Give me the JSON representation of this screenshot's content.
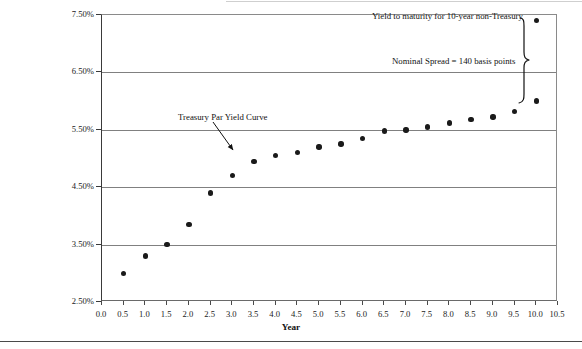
{
  "chart_data": {
    "type": "scatter",
    "title": "",
    "xlabel": "Year",
    "ylabel": "",
    "xlim": [
      0.0,
      10.5
    ],
    "ylim": [
      2.5,
      7.5
    ],
    "grid": true,
    "legend_position": "none",
    "x_tick_labels": [
      "0.0",
      "0.5",
      "1.0",
      "1.5",
      "2.0",
      "2.5",
      "3.0",
      "3.5",
      "4.0",
      "4.5",
      "5.0",
      "5.5",
      "6.0",
      "6.5",
      "7.0",
      "7.5",
      "8.0",
      "8.5",
      "9.0",
      "9.5",
      "10.0",
      "10.5"
    ],
    "x_tick_values": [
      0.0,
      0.5,
      1.0,
      1.5,
      2.0,
      2.5,
      3.0,
      3.5,
      4.0,
      4.5,
      5.0,
      5.5,
      6.0,
      6.5,
      7.0,
      7.5,
      8.0,
      8.5,
      9.0,
      9.5,
      10.0,
      10.5
    ],
    "y_tick_labels": [
      "7.50%",
      "6.50%",
      "5.50%",
      "4.50%",
      "3.50%",
      "2.50%"
    ],
    "y_tick_values": [
      7.5,
      6.5,
      5.5,
      4.5,
      3.5,
      2.5
    ],
    "series": [
      {
        "name": "Treasury Par Yield Curve",
        "x": [
          0.5,
          1.0,
          1.5,
          2.0,
          2.5,
          3.0,
          3.5,
          4.0,
          4.5,
          5.0,
          5.5,
          6.0,
          6.5,
          7.0,
          7.5,
          8.0,
          8.5,
          9.0,
          9.5,
          10.0
        ],
        "values": [
          3.0,
          3.3,
          3.5,
          3.85,
          4.4,
          4.7,
          4.95,
          5.05,
          5.1,
          5.2,
          5.25,
          5.35,
          5.48,
          5.5,
          5.55,
          5.62,
          5.68,
          5.72,
          5.82,
          6.0
        ]
      },
      {
        "name": "Yield to maturity for 10-year non-Treasury",
        "x": [
          10.0
        ],
        "values": [
          7.4
        ]
      }
    ],
    "annotations": [
      {
        "name": "treasury-par-yield-curve",
        "text": "Treasury Par Yield Curve",
        "arrow": true
      },
      {
        "name": "yield-to-maturity-non-treasury",
        "text": "Yield to maturity for 10-year non-Treasury",
        "arrow": false
      },
      {
        "name": "nominal-spread",
        "text": "Nominal Spread = 140 basis points",
        "brace": true
      }
    ]
  },
  "axes": {
    "x_title": "Year"
  },
  "colors": {
    "marker": "#1a1a1a",
    "gridline": "#808080",
    "axis": "#3a3a3a",
    "text": "#111111",
    "background": "#ffffff"
  }
}
